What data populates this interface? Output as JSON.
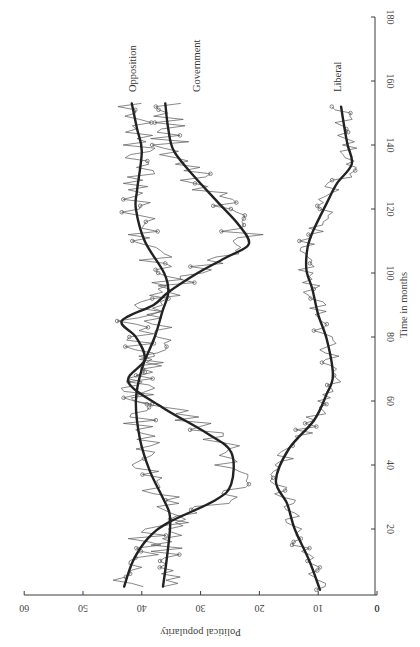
{
  "chart_data": {
    "type": "line",
    "title": "",
    "orientation": "rotated 90 degrees clockwise (time axis vertical, popularity axis horizontal)",
    "xlabel": "Time in months",
    "ylabel": "Political popularity",
    "xlim": [
      0,
      180
    ],
    "ylim": [
      0,
      60
    ],
    "x_ticks": [
      0,
      20,
      40,
      60,
      80,
      100,
      120,
      140,
      160,
      180
    ],
    "y_ticks": [
      0,
      10,
      20,
      30,
      40,
      50,
      60
    ],
    "grid": false,
    "legend": "inline labels at end of series",
    "series": [
      {
        "name": "Opposition",
        "style": "smoothed (thick)",
        "x": [
          2,
          10,
          20,
          25,
          30,
          38,
          48,
          60,
          70,
          80,
          88,
          94,
          100,
          110,
          120,
          126,
          138,
          145,
          153
        ],
        "y": [
          36.4,
          35.8,
          35.2,
          35.3,
          36.5,
          38.6,
          40.3,
          41.0,
          40.0,
          37.8,
          36.5,
          35.5,
          36.2,
          39.5,
          41.0,
          40.8,
          40.0,
          40.8,
          41.7
        ]
      },
      {
        "name": "Government",
        "style": "smoothed (thick)",
        "x": [
          2,
          10,
          17,
          22,
          29,
          34,
          44,
          50,
          58,
          66,
          73,
          80,
          85,
          90,
          94,
          100,
          105,
          109,
          115,
          122,
          130,
          138,
          145,
          153
        ],
        "y": [
          43.0,
          41.5,
          39.0,
          35.5,
          27.5,
          24.8,
          24.8,
          29.0,
          36.5,
          42.3,
          39.5,
          41.0,
          43.4,
          38.0,
          35.5,
          30.5,
          25.5,
          21.8,
          23.5,
          27.0,
          31.0,
          34.5,
          35.5,
          36.0
        ]
      },
      {
        "name": "Liberal",
        "style": "smoothed (thick)",
        "x": [
          1,
          10,
          20,
          28,
          35,
          45,
          54,
          62,
          68,
          79,
          87,
          95,
          101,
          108,
          113,
          122,
          128,
          134,
          140,
          146,
          152
        ],
        "y": [
          9.7,
          11.5,
          14.0,
          15.3,
          17.2,
          15.0,
          10.7,
          8.6,
          7.5,
          8.5,
          10.0,
          11.0,
          12.0,
          11.8,
          10.9,
          8.5,
          6.8,
          4.3,
          5.0,
          5.6,
          6.1
        ]
      }
    ],
    "raw_series_note": "Each series also drawn as a thin jagged monthly line with small loop markers around the smoothed curve"
  },
  "labels": {
    "x_axis": "Time in months",
    "y_axis": "Political popularity",
    "opposition": "Opposition",
    "government": "Government",
    "liberal": "Liberal"
  }
}
